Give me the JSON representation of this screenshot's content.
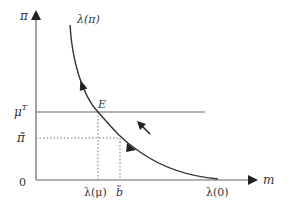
{
  "diagram": {
    "y_axis_label": "π",
    "x_axis_label": "m",
    "origin_label": "0",
    "curve_label": "λ(π)",
    "equilibrium_label": "E",
    "horizontal_line_label_base": "μ",
    "horizontal_line_label_sup": "T",
    "dotted_level_label": "π̃",
    "x_tick_lambda_mu": "λ(μ)",
    "x_tick_b_tilde": "b̃",
    "x_intercept_label": "λ(0)",
    "colors": {
      "axis": "#666666",
      "curve": "#333333",
      "dotted": "#777777",
      "text": "#333333"
    }
  }
}
